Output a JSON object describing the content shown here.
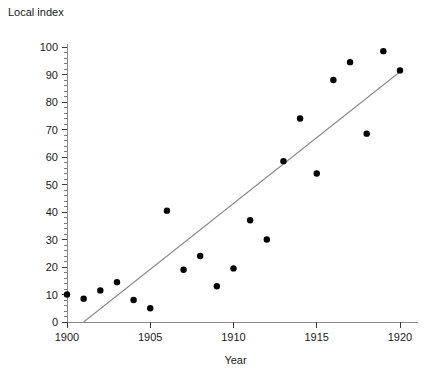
{
  "chart_data": {
    "type": "scatter",
    "title": "",
    "xlabel": "Year",
    "ylabel": "Local index",
    "xlim": [
      1900,
      1920
    ],
    "ylim": [
      0,
      100
    ],
    "x_ticks": [
      1900,
      1905,
      1910,
      1915,
      1920
    ],
    "x_tick_labels": [
      "1900",
      "1905",
      "1910",
      "1915",
      "1920"
    ],
    "y_ticks": [
      0,
      10,
      20,
      30,
      40,
      50,
      60,
      70,
      80,
      90,
      100
    ],
    "y_tick_labels": [
      "0",
      "10",
      "20",
      "30",
      "40",
      "50",
      "60",
      "70",
      "80",
      "90",
      "100"
    ],
    "grid": false,
    "legend": false,
    "y_minor_ticks_per_major": 5,
    "points": [
      {
        "x": 1900,
        "y": 10
      },
      {
        "x": 1901,
        "y": 8.5
      },
      {
        "x": 1902,
        "y": 11.5
      },
      {
        "x": 1903,
        "y": 14.5
      },
      {
        "x": 1904,
        "y": 8
      },
      {
        "x": 1905,
        "y": 5
      },
      {
        "x": 1906,
        "y": 40.5
      },
      {
        "x": 1907,
        "y": 19
      },
      {
        "x": 1908,
        "y": 24
      },
      {
        "x": 1909,
        "y": 13
      },
      {
        "x": 1910,
        "y": 19.5
      },
      {
        "x": 1911,
        "y": 37
      },
      {
        "x": 1912,
        "y": 30
      },
      {
        "x": 1913,
        "y": 58.5
      },
      {
        "x": 1914,
        "y": 74
      },
      {
        "x": 1915,
        "y": 54
      },
      {
        "x": 1916,
        "y": 88
      },
      {
        "x": 1917,
        "y": 94.5
      },
      {
        "x": 1918,
        "y": 68.5
      },
      {
        "x": 1919,
        "y": 98.5
      },
      {
        "x": 1920,
        "y": 91.5
      }
    ],
    "trend_line": {
      "name": "fitted-regression-line",
      "x_start": 1901,
      "y_start": 0,
      "x_end": 1920,
      "y_end": 91
    }
  },
  "axes": {
    "y_axis_title": "Local index",
    "x_axis_title": "Year"
  }
}
